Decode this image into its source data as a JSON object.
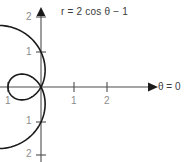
{
  "figure": {
    "equation_label": "r = 2 cos θ − 1",
    "theta_label": "θ = 0",
    "colors": {
      "curve": "#1a1a1a",
      "axis": "#4d4d4d",
      "tick_label": "#8c8c8c",
      "text": "#3b3b3b",
      "background": "#ffffff"
    }
  },
  "axes": {
    "y_ticks_top": [
      "2",
      "1"
    ],
    "y_ticks_bottom": [
      "1",
      "2"
    ],
    "x_tick_negative": "1",
    "x_ticks_positive": [
      "1",
      "2"
    ]
  },
  "chart_data": {
    "type": "line",
    "title": "r = 2 cos θ − 1",
    "subtitle": "",
    "plot_kind": "polar limacon with inner loop",
    "polar_equation": "r = 2*cos(theta) - 1",
    "xlabel": "θ = 0",
    "ylabel": "",
    "xlim": [
      -1.3,
      4.4
    ],
    "ylim": [
      -2.2,
      2.3
    ],
    "grid": false,
    "legend": null,
    "origin_px": [
      41,
      87
    ],
    "unit_px": [
      33,
      35
    ],
    "x_tick_labels": [
      "1",
      "1",
      "2"
    ],
    "x_tick_values": [
      -1,
      1,
      2
    ],
    "y_tick_labels": [
      "2",
      "1",
      "1",
      "2"
    ],
    "y_tick_values": [
      2,
      1,
      -1,
      -2
    ],
    "annotations": [
      {
        "text": "r = 2 cos θ − 1",
        "x": 1.0,
        "y": 2.15
      },
      {
        "text": "θ = 0",
        "x": 3.7,
        "y": 0.0
      }
    ],
    "key_points": [
      {
        "label": "theta=0 (outer max)",
        "theta": 0,
        "r": 1.0,
        "x": 1.0,
        "y": 0.0
      },
      {
        "label": "theta=pi/3 (cusp at pole)",
        "theta": 1.0472,
        "r": 0.0,
        "x": 0.0,
        "y": 0.0
      },
      {
        "label": "theta=pi/2",
        "theta": 1.5708,
        "r": -1.0,
        "x": 0.0,
        "y": -1.0
      },
      {
        "label": "theta=pi (inner extreme)",
        "theta": 3.1416,
        "r": -3.0,
        "x": 3.0,
        "y": 0.0
      },
      {
        "label": "top of outer curve",
        "theta": 4.1888,
        "r": -2.0,
        "x": 1.0,
        "y": 1.732
      },
      {
        "label": "bottom of outer curve",
        "theta": 2.0944,
        "r": -2.0,
        "x": 1.0,
        "y": -1.732
      }
    ],
    "series": [
      {
        "name": "r = 2 cos θ − 1",
        "theta_start": 0,
        "theta_end": 6.2832,
        "samples": 360,
        "values_note": "Cartesian points computed as x = (2cos t - 1)cos t, y = (2cos t - 1)sin t, then reflected about the vertical axis so the large lobe opens to the right as drawn."
      }
    ]
  }
}
